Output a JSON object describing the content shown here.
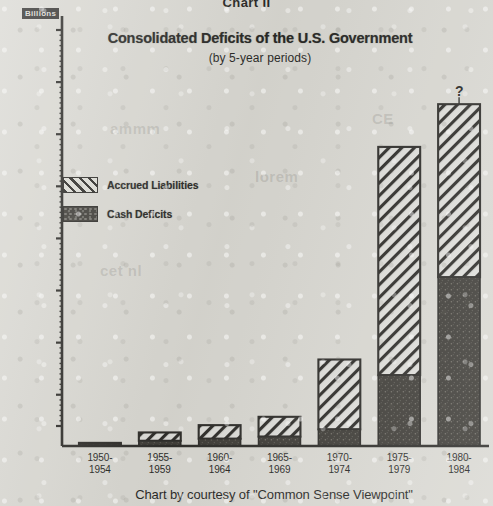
{
  "header": {
    "chart_number": "Chart II"
  },
  "title": "Consolidated Deficits of the U.S. Government",
  "subtitle": "(by 5-year periods)",
  "axis_unit_label": "Billions",
  "credit": "Chart by courtesy of \"Common Sense Viewpoint\"",
  "annotation_question_mark": "?",
  "legend": {
    "items": [
      {
        "label": "Accrued Liabilities",
        "pattern": "diagonal-hatch",
        "color": "#ddddd6"
      },
      {
        "label": "Cash Deficits",
        "pattern": "solid-dark",
        "color": "#35332e"
      }
    ]
  },
  "ghost_text": [
    {
      "text": "ammm",
      "x": 110,
      "y": 120
    },
    {
      "text": "lorem",
      "x": 255,
      "y": 168
    },
    {
      "text": "cet nl",
      "x": 100,
      "y": 262
    },
    {
      "text": "CE",
      "x": 372,
      "y": 110
    }
  ],
  "colors": {
    "paper": "#d9d8d2",
    "ink": "#23221f",
    "cash_fill": "#35332e",
    "accrued_fill": "#ddddd6",
    "accrued_hatch": "#23221f"
  },
  "chart_data": {
    "type": "bar",
    "subtype": "stacked-bar",
    "title": "Consolidated Deficits of the U.S. Government",
    "subtitle": "(by 5-year periods)",
    "xlabel": "",
    "ylabel": "Billions",
    "grid": false,
    "legend_position": "inside-upper-left",
    "ylim": [
      0,
      2000
    ],
    "yticks": [
      100,
      250,
      500,
      750,
      1000,
      1250,
      1500,
      1750,
      2000
    ],
    "ytick_labels": [
      "100",
      "250",
      "500",
      "750",
      "1,000",
      "1,250",
      "1,500",
      "1,750",
      "2,000"
    ],
    "categories": [
      "1950-1954",
      "1955-1959",
      "1960-1964",
      "1965-1969",
      "1970-1974",
      "1975-1979",
      "1980-1984"
    ],
    "category_lines": [
      [
        "1950-",
        "1954"
      ],
      [
        "1955-",
        "1959"
      ],
      [
        "1960-",
        "1964"
      ],
      [
        "1965-",
        "1969"
      ],
      [
        "1970-",
        "1974"
      ],
      [
        "1975-",
        "1979"
      ],
      [
        "1980-",
        "1984"
      ]
    ],
    "series": [
      {
        "name": "Cash Deficits",
        "values": [
          10,
          25,
          35,
          45,
          80,
          340,
          810
        ]
      },
      {
        "name": "Accrued Liabilities",
        "values": [
          5,
          40,
          65,
          95,
          335,
          1095,
          830
        ]
      }
    ],
    "totals": [
      15,
      65,
      100,
      140,
      415,
      1435,
      1640
    ],
    "annotations": [
      {
        "text": "?",
        "category": "1980-1984",
        "note": "projected / uncertain"
      }
    ]
  }
}
